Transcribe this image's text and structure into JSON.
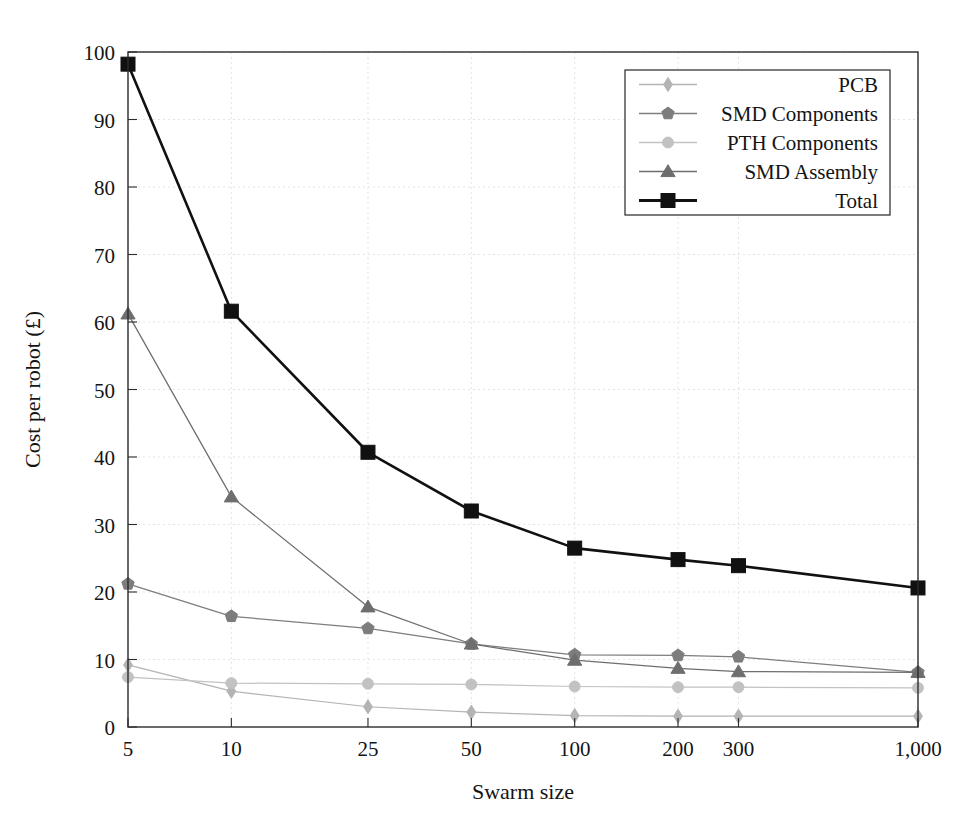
{
  "chart_data": {
    "type": "line",
    "title": "",
    "xlabel": "Swarm size",
    "ylabel": "Cost per robot (£)",
    "xscale": "log",
    "x": [
      5,
      10,
      25,
      50,
      100,
      200,
      300,
      1000
    ],
    "xtick_labels": [
      "5",
      "10",
      "25",
      "50",
      "100",
      "200",
      "300",
      "1,000"
    ],
    "ytick_labels": [
      "0",
      "10",
      "20",
      "30",
      "40",
      "50",
      "60",
      "70",
      "80",
      "90",
      "100"
    ],
    "yticks": [
      0,
      10,
      20,
      30,
      40,
      50,
      60,
      70,
      80,
      90,
      100
    ],
    "ylim": [
      0,
      100
    ],
    "xlim": [
      5,
      1000
    ],
    "grid": true,
    "legend_position": "top-right",
    "series": [
      {
        "name": "PCB",
        "marker": "diamond",
        "color": "#b4b4b4",
        "values": [
          9.2,
          5.3,
          3.0,
          2.2,
          1.7,
          1.6,
          1.6,
          1.6
        ]
      },
      {
        "name": "SMD Components",
        "marker": "pentagon",
        "color": "#7d7d7d",
        "values": [
          21.2,
          16.4,
          14.6,
          12.3,
          10.7,
          10.6,
          10.4,
          8.1
        ]
      },
      {
        "name": "PTH Components",
        "marker": "circle",
        "color": "#c2c2c2",
        "values": [
          7.4,
          6.5,
          6.4,
          6.3,
          6.0,
          5.9,
          5.9,
          5.8
        ]
      },
      {
        "name": "SMD Assembly",
        "marker": "triangle",
        "color": "#6e6e6e",
        "values": [
          61.2,
          34.1,
          17.8,
          12.3,
          9.9,
          8.7,
          8.2,
          8.1
        ]
      },
      {
        "name": "Total",
        "marker": "square",
        "color": "#111111",
        "values": [
          98.2,
          61.6,
          40.7,
          32.0,
          26.5,
          24.8,
          23.9,
          20.6
        ]
      }
    ]
  }
}
